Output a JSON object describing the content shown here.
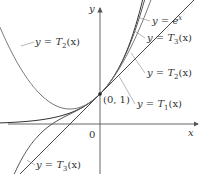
{
  "chart_data": {
    "type": "line",
    "title": "",
    "xlabel": "x",
    "ylabel": "y",
    "origin_label": "0",
    "point_label": "(0, 1)",
    "point": [
      0,
      1
    ],
    "xlim": [
      -3.33,
      3.4
    ],
    "ylim": [
      -1.67,
      4.13
    ],
    "grid": false,
    "series": [
      {
        "name": "y = e^x",
        "func": "exp",
        "color": "#333333"
      },
      {
        "name": "y = T_3(x)",
        "func": "T3",
        "color": "#555555"
      },
      {
        "name": "y = T_2(x)",
        "func": "T2",
        "color": "#777777"
      },
      {
        "name": "y = T_1(x)",
        "func": "T1",
        "color": "#444444"
      }
    ],
    "labels": [
      {
        "text_main": "y = e",
        "sup": "x",
        "x": 152,
        "y": 24
      },
      {
        "text_main": "y = T",
        "sub": "3",
        "tail": "(x)",
        "x": 147,
        "y": 41
      },
      {
        "text_main": "y = T",
        "sub": "2",
        "tail": "(x)",
        "x": 147,
        "y": 76
      },
      {
        "text_main": "y = T",
        "sub": "1",
        "tail": "(x)",
        "x": 137,
        "y": 107
      },
      {
        "text_main": "y = T",
        "sub": "2",
        "tail": "(x)",
        "x": 35,
        "y": 45
      },
      {
        "text_main": "y = T",
        "sub": "3",
        "tail": "(x)",
        "x": 36,
        "y": 168
      }
    ]
  }
}
